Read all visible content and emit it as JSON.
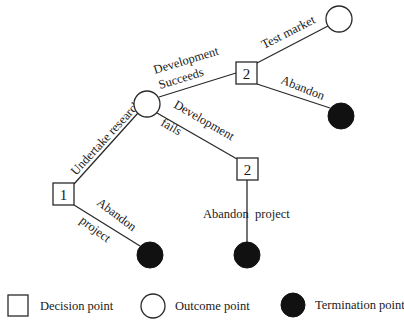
{
  "diagram": {
    "type": "decision-tree",
    "nodes": [
      {
        "id": "d1",
        "kind": "decision",
        "label": "1"
      },
      {
        "id": "o1",
        "kind": "outcome",
        "label": ""
      },
      {
        "id": "d2a",
        "kind": "decision",
        "label": "2"
      },
      {
        "id": "d2b",
        "kind": "decision",
        "label": "2"
      },
      {
        "id": "o2",
        "kind": "outcome",
        "label": ""
      },
      {
        "id": "t1",
        "kind": "termination",
        "label": ""
      },
      {
        "id": "t2",
        "kind": "termination",
        "label": ""
      },
      {
        "id": "t3",
        "kind": "termination",
        "label": ""
      }
    ],
    "edges": [
      {
        "from": "d1",
        "to": "o1",
        "label": "Undertake research"
      },
      {
        "from": "d1",
        "to": "t1",
        "label_line1": "Abandon",
        "label_line2": "project"
      },
      {
        "from": "o1",
        "to": "d2a",
        "label_line1": "Development",
        "label_line2": "Succeeds"
      },
      {
        "from": "o1",
        "to": "d2b",
        "label_line1": "Development",
        "label_line2": "fails"
      },
      {
        "from": "d2a",
        "to": "o2",
        "label": "Test market"
      },
      {
        "from": "d2a",
        "to": "t2",
        "label": "Abandon"
      },
      {
        "from": "d2b",
        "to": "t3",
        "label": "Abandon  project"
      }
    ]
  },
  "legend": {
    "decision": "Decision point",
    "outcome": "Outcome point",
    "termination": "Termination point"
  }
}
